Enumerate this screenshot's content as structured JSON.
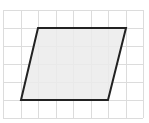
{
  "diagram": {
    "type": "parallelogram-on-grid",
    "canvas": {
      "width": 149,
      "height": 123
    },
    "grid": {
      "color": "#dcdcdc",
      "vertical_x": [
        3,
        21,
        38,
        56,
        73,
        91,
        108,
        126,
        143
      ],
      "horizontal_y": [
        10,
        28,
        46,
        64,
        82,
        100,
        118
      ],
      "x_extent": [
        3,
        143
      ],
      "y_extent": [
        10,
        118
      ]
    },
    "shape": {
      "name": "parallelogram",
      "fill": "#ebebeb",
      "stroke": "#222222",
      "stroke_width": 2,
      "vertices": [
        [
          38,
          28
        ],
        [
          126,
          28
        ],
        [
          108,
          100
        ],
        [
          21,
          100
        ]
      ],
      "grid_units": {
        "base": 5,
        "height": 4,
        "offset": 1
      }
    }
  }
}
